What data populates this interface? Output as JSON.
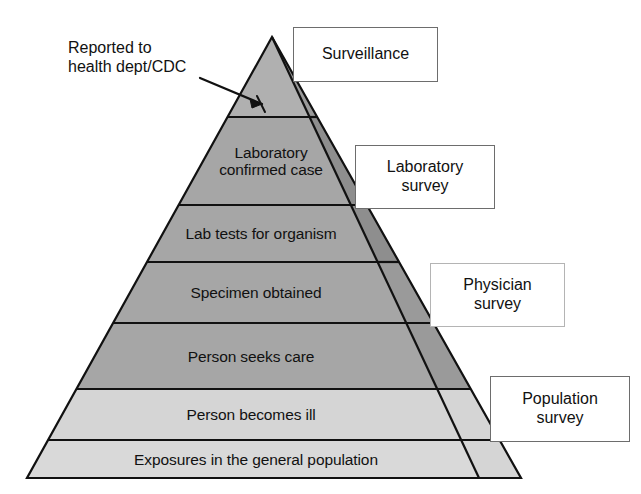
{
  "figure": {
    "type": "pyramid-diagram",
    "title_visible": false,
    "background_color": "#ffffff"
  },
  "annotation": {
    "text": "Reported to\nhealth dept/CDC",
    "pointer": "arrow-to-apex"
  },
  "pyramid": {
    "apex": {
      "x": 272,
      "y": 37
    },
    "base_left": {
      "x": 27,
      "y": 478
    },
    "base_right": {
      "x": 521,
      "y": 478
    },
    "outline_color": "#111111",
    "layers": [
      {
        "id": "reported",
        "label": "",
        "fill": "#b0b0b0",
        "y_top": 37,
        "y_bottom": 117
      },
      {
        "id": "laboratory-confirmed-case",
        "label": "Laboratory\nconfirmed case",
        "fill": "#a6a6a6",
        "y_top": 117,
        "y_bottom": 205
      },
      {
        "id": "lab-tests-for-organism",
        "label": "Lab tests for organism",
        "fill": "#a6a6a6",
        "y_top": 205,
        "y_bottom": 262
      },
      {
        "id": "specimen-obtained",
        "label": "Specimen obtained",
        "fill": "#a6a6a6",
        "y_top": 262,
        "y_bottom": 323
      },
      {
        "id": "person-seeks-care",
        "label": "Person seeks care",
        "fill": "#a6a6a6",
        "y_top": 323,
        "y_bottom": 389
      },
      {
        "id": "person-becomes-ill",
        "label": "Person becomes ill",
        "fill": "#d5d5d5",
        "y_top": 389,
        "y_bottom": 440
      },
      {
        "id": "exposures-in-general-population",
        "label": "Exposures in the general population",
        "fill": "#d9d9d9",
        "y_top": 440,
        "y_bottom": 478
      }
    ],
    "side_strip": {
      "description": "Shaded strip along the right face of the pyramid, divided into four survey bands",
      "bands": [
        {
          "id": "surveillance-band",
          "fill": "#9a9a9a",
          "y_top": 37,
          "y_bottom": 117
        },
        {
          "id": "laboratory-survey-band",
          "fill": "#8e8e8e",
          "y_top": 117,
          "y_bottom": 262
        },
        {
          "id": "physician-survey-band",
          "fill": "#9a9a9a",
          "y_top": 262,
          "y_bottom": 389
        },
        {
          "id": "population-survey-band",
          "fill": "#d5d5d5",
          "y_top": 389,
          "y_bottom": 478
        }
      ]
    }
  },
  "callouts": [
    {
      "id": "surveillance",
      "label": "Surveillance",
      "x": 293,
      "y": 27,
      "width": 145,
      "height": 55,
      "border_style": "solid"
    },
    {
      "id": "laboratory-survey",
      "label": "Laboratory\nsurvey",
      "x": 355,
      "y": 145,
      "width": 140,
      "height": 64,
      "border_style": "solid"
    },
    {
      "id": "physician-survey",
      "label": "Physician\nsurvey",
      "x": 430,
      "y": 263,
      "width": 135,
      "height": 64,
      "border_style": "faint"
    },
    {
      "id": "population-survey",
      "label": "Population\nsurvey",
      "x": 490,
      "y": 376,
      "width": 140,
      "height": 66,
      "border_style": "solid"
    }
  ]
}
